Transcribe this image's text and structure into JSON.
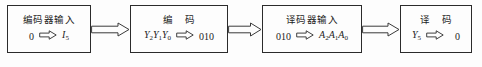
{
  "diagram": {
    "type": "flow-diagram",
    "colors": {
      "border": "#2b2b2b",
      "text": "#1c1c1c",
      "background": "#fdfdfd",
      "arrow_stroke": "#3a3a3a"
    },
    "inline_arrow_glyph": "block-arrow-right",
    "connector_arrow_glyph": "hollow-block-arrow-right",
    "stages": [
      {
        "id": "encoder-input",
        "title": "编码器输入",
        "title_spaced": false,
        "expression": {
          "left": "0",
          "left_italic": false,
          "left_sub": "",
          "arrow": "⇨",
          "right": "I",
          "right_italic": true,
          "right_sub": "5"
        }
      },
      {
        "id": "encode",
        "title": "编 码",
        "title_spaced": true,
        "expression": {
          "left": "Y2Y1Y0",
          "left_italic": true,
          "left_sub": "",
          "arrow": "⇨",
          "right": "010",
          "right_italic": false,
          "right_sub": ""
        }
      },
      {
        "id": "decoder-input",
        "title": "译码器输入",
        "title_spaced": false,
        "expression": {
          "left": "010",
          "left_italic": false,
          "left_sub": "",
          "arrow": "⇨",
          "right": "A2A1A0",
          "right_italic": true,
          "right_sub": ""
        }
      },
      {
        "id": "decode",
        "title": "译 码",
        "title_spaced": true,
        "expression": {
          "left": "Y",
          "left_italic": true,
          "left_sub": "5",
          "arrow": "⇨",
          "right": "0",
          "right_italic": false,
          "right_sub": ""
        }
      }
    ],
    "connectors": [
      {
        "id": "connector-encoder-input-to-encode",
        "label": ""
      },
      {
        "id": "connector-encode-to-decoder-input",
        "label": ""
      },
      {
        "id": "connector-decoder-input-to-decode",
        "label": ""
      }
    ],
    "caption_sliver": ""
  }
}
